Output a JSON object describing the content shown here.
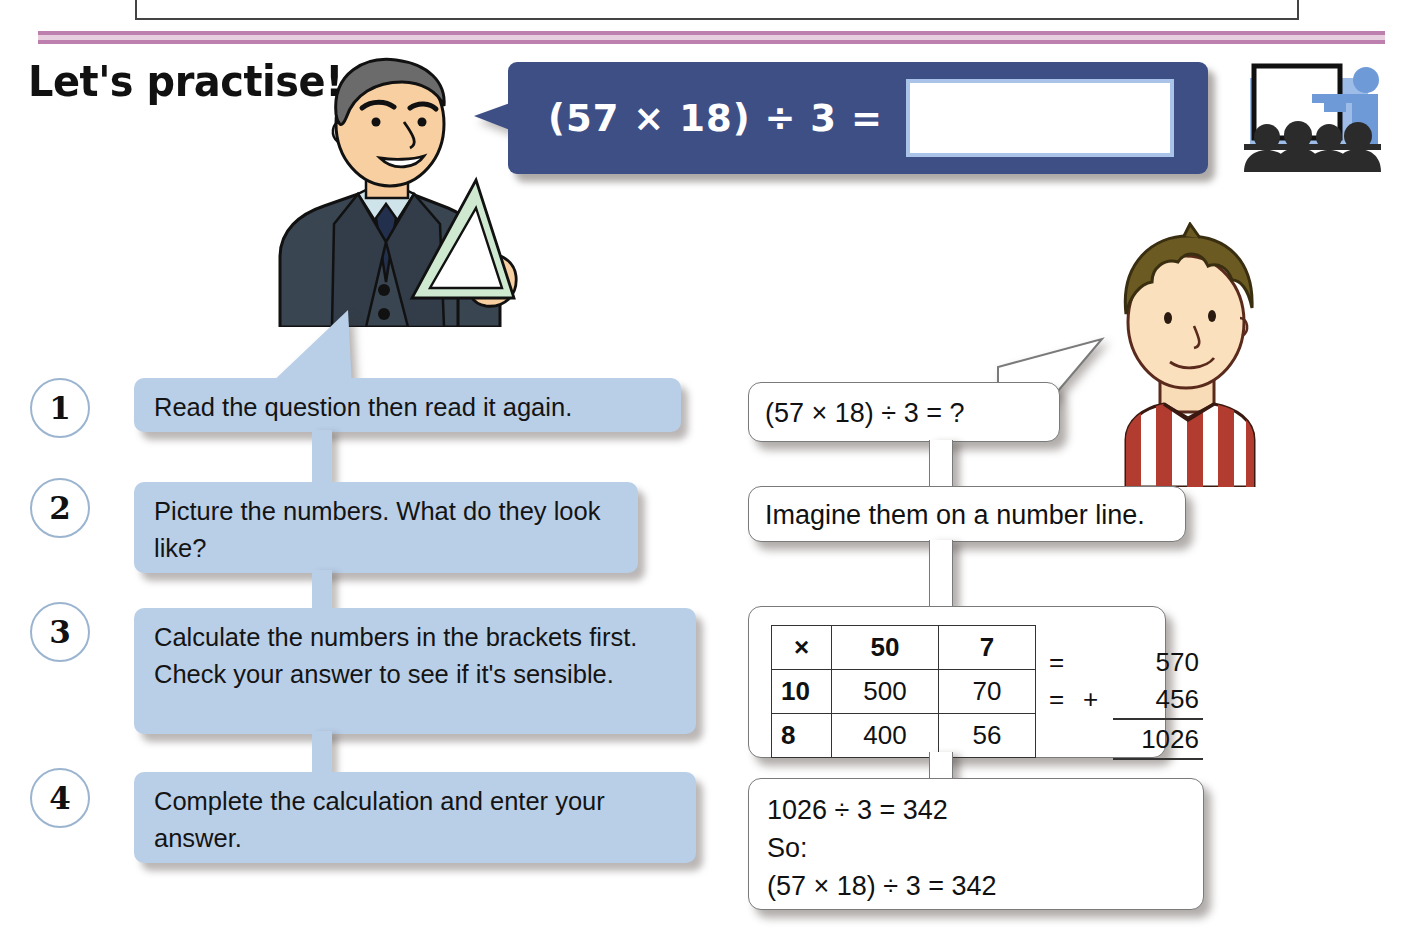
{
  "page": {
    "title": "Let's practise!"
  },
  "banner": {
    "equation": "(57 × 18) ÷ 3 =",
    "answer_value": "",
    "answer_placeholder": ""
  },
  "icons": {
    "classroom": "classroom-icon",
    "teacher": "teacher-character",
    "boy": "boy-character",
    "set_square": "set-square-icon"
  },
  "steps": [
    {
      "number": "1",
      "text": "Read the question then read it again."
    },
    {
      "number": "2",
      "text": "Picture the numbers. What do they look like?"
    },
    {
      "number": "3",
      "text": "Calculate the numbers in the brackets first. Check your answer to see if it's sensible."
    },
    {
      "number": "4",
      "text": "Complete the calculation and enter your answer."
    }
  ],
  "thoughts": {
    "question": "(57 × 18) ÷ 3 = ?",
    "number_line": "Imagine them on a number line."
  },
  "grid": {
    "header": [
      "×",
      "50",
      "7"
    ],
    "rows": [
      {
        "label": "10",
        "cells": [
          "500",
          "70"
        ]
      },
      {
        "label": "8",
        "cells": [
          "400",
          "56"
        ]
      }
    ],
    "sums": {
      "eq1": "=",
      "value1": "570",
      "eq2": "=",
      "plus": "+",
      "value2": "456",
      "total": "1026"
    }
  },
  "conclusion": {
    "line1": "1026 ÷ 3 = 342",
    "line2": "So:",
    "line3": "(57 × 18) ÷ 3 = 342"
  },
  "colors": {
    "banner_blue": "#3e4f86",
    "step_blue": "#b9cfe8",
    "rule_pink": "#bd7fae",
    "answer_border": "#a9c4e8"
  }
}
